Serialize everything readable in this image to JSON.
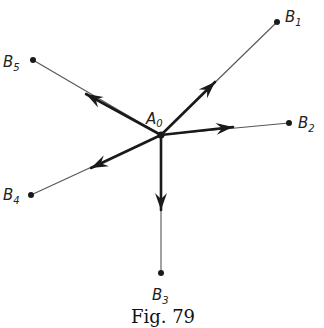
{
  "figure": {
    "caption": "Fig. 79",
    "center": {
      "name": "A",
      "sub": "0",
      "x": 161,
      "y": 135
    },
    "points": [
      {
        "name": "B",
        "sub": "1",
        "x": 277,
        "y": 22,
        "label_x": 285,
        "label_y": 22,
        "arrow_tip_x": 215,
        "arrow_tip_y": 82
      },
      {
        "name": "B",
        "sub": "2",
        "x": 289,
        "y": 123,
        "label_x": 298,
        "label_y": 128,
        "arrow_tip_x": 233,
        "arrow_tip_y": 127
      },
      {
        "name": "B",
        "sub": "3",
        "x": 161,
        "y": 273,
        "label_x": 152,
        "label_y": 300,
        "arrow_tip_x": 161,
        "arrow_tip_y": 210
      },
      {
        "name": "B",
        "sub": "4",
        "x": 31,
        "y": 195,
        "label_x": 3,
        "label_y": 200,
        "arrow_tip_x": 91,
        "arrow_tip_y": 168
      },
      {
        "name": "B",
        "sub": "5",
        "x": 33,
        "y": 60,
        "label_x": 3,
        "label_y": 67,
        "arrow_tip_x": 86,
        "arrow_tip_y": 94
      }
    ],
    "colors": {
      "ink": "#1a1a1a",
      "thin_line": "#555555",
      "background": "#ffffff"
    }
  }
}
